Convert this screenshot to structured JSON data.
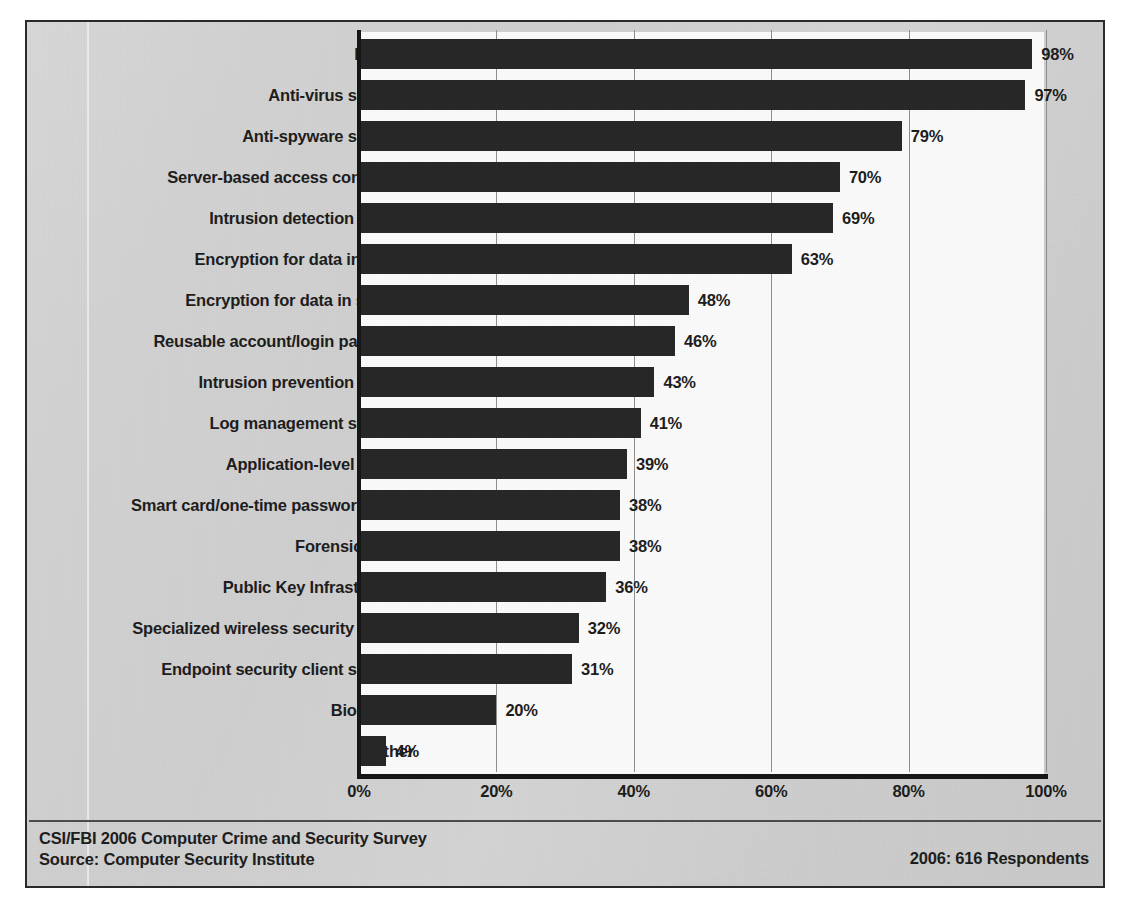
{
  "chart_data": {
    "type": "bar",
    "orientation": "horizontal",
    "title": "",
    "xlabel": "",
    "ylabel": "",
    "xlim": [
      0,
      100
    ],
    "xticks": [
      "0%",
      "20%",
      "40%",
      "60%",
      "80%",
      "100%"
    ],
    "xtick_values": [
      0,
      20,
      40,
      60,
      80,
      100
    ],
    "grid": "vertical",
    "legend": "none",
    "bar_color": "#252525",
    "plot_background": "#fbfbfb",
    "page_background": "#d2d2d2",
    "categories": [
      "Firewall",
      "Anti-virus software",
      "Anti-spyware software",
      "Server-based access control list",
      "Intrusion detection system",
      "Encryption for data in transit",
      "Encryption for data in storage",
      "Reusable account/login password",
      "Intrusion prevention system",
      "Log management software",
      "Application-level firewall",
      "Smart card/one-time password token",
      "Forensics tools",
      "Public Key Infrastructure",
      "Specialized wireless security system",
      "Endpoint security client software",
      "Biometrics",
      "Other"
    ],
    "values": [
      98,
      97,
      79,
      70,
      69,
      63,
      48,
      46,
      43,
      41,
      39,
      38,
      38,
      36,
      32,
      31,
      20,
      4
    ],
    "value_labels": [
      "98%",
      "97%",
      "79%",
      "70%",
      "69%",
      "63%",
      "48%",
      "46%",
      "43%",
      "41%",
      "39%",
      "38%",
      "38%",
      "36%",
      "32%",
      "31%",
      "20%",
      "4%"
    ]
  },
  "footer": {
    "source_line1": "CSI/FBI 2006 Computer Crime and Security Survey",
    "source_line2": "Source: Computer Security Institute",
    "respondents": "2006: 616 Respondents"
  }
}
